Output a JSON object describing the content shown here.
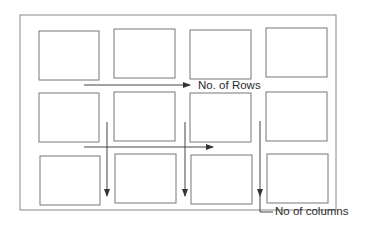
{
  "diagram": {
    "type": "grid-layout-illustration",
    "grid": {
      "rows": 3,
      "columns": 4
    },
    "labels": {
      "rows": "No. of Rows",
      "columns": "No of columns"
    },
    "colors": {
      "stroke": "#6e6e6e",
      "arrow": "#333333",
      "text": "#2a2a2a",
      "background": "#ffffff"
    }
  }
}
